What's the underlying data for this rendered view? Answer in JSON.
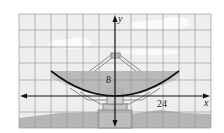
{
  "figure": {
    "grid": {
      "cell_units": 8,
      "x_cells_left": 6,
      "x_cells_right": 6,
      "y_cells_up": 5,
      "y_cells_down": 2
    },
    "axes": {
      "x_label": "x",
      "y_label": "y"
    },
    "labels": {
      "height_value": "8",
      "width_value": "24"
    },
    "parabola": {
      "equation": "x^2 = 72y",
      "vertex": [
        0,
        0
      ],
      "marked_point": [
        24,
        8
      ],
      "x_extent": [
        -32,
        32
      ]
    },
    "colors": {
      "grid_line": "#9a9a9a",
      "background_sky": "#eeeeee",
      "cloud": "#fafafa",
      "ground": "#b5b5b5",
      "dish_fill": "#a8a8a8",
      "dish_structure": "#8a8a8a",
      "curve": "#111111",
      "axis": "#111111"
    }
  }
}
